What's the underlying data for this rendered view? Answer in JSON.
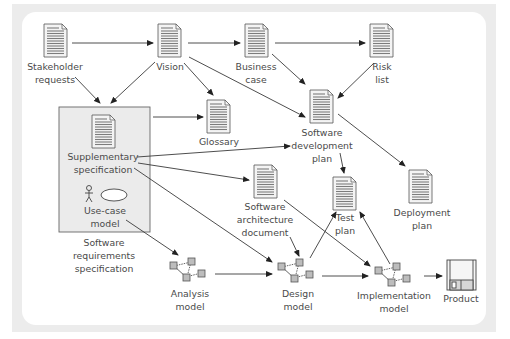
{
  "diagram": {
    "type": "artifact-flow",
    "nodes": [
      {
        "id": "stakeholder-requests",
        "icon": "document-icon",
        "label_lines": [
          "Stakeholder",
          "requests"
        ]
      },
      {
        "id": "vision",
        "icon": "document-icon",
        "label_lines": [
          "Vision"
        ]
      },
      {
        "id": "business-case",
        "icon": "document-icon",
        "label_lines": [
          "Business",
          "case"
        ]
      },
      {
        "id": "risk-list",
        "icon": "document-icon",
        "label_lines": [
          "Risk",
          "list"
        ]
      },
      {
        "id": "glossary",
        "icon": "document-icon",
        "label_lines": [
          "Glossary"
        ]
      },
      {
        "id": "supplementary-specification",
        "icon": "document-icon",
        "label_lines": [
          "Supplementary",
          "specification"
        ]
      },
      {
        "id": "use-case-model",
        "icon": "use-case-icon",
        "label_lines": [
          "Use-case",
          "model"
        ]
      },
      {
        "id": "software-requirements-specification",
        "icon": "group-box",
        "label_lines": [
          "Software",
          "requirements",
          "specification"
        ]
      },
      {
        "id": "software-development-plan",
        "icon": "document-icon",
        "label_lines": [
          "Software",
          "development",
          "plan"
        ]
      },
      {
        "id": "software-architecture-document",
        "icon": "document-icon",
        "label_lines": [
          "Software",
          "architecture",
          "document"
        ]
      },
      {
        "id": "test-plan",
        "icon": "document-icon",
        "label_lines": [
          "Test",
          "plan"
        ]
      },
      {
        "id": "deployment-plan",
        "icon": "document-icon",
        "label_lines": [
          "Deployment",
          "plan"
        ]
      },
      {
        "id": "analysis-model",
        "icon": "model-graph-icon",
        "label_lines": [
          "Analysis",
          "model"
        ]
      },
      {
        "id": "design-model",
        "icon": "model-graph-icon",
        "label_lines": [
          "Design",
          "model"
        ]
      },
      {
        "id": "implementation-model",
        "icon": "model-graph-icon",
        "label_lines": [
          "Implementation",
          "model"
        ]
      },
      {
        "id": "product",
        "icon": "floppy-disk-icon",
        "label_lines": [
          "Product"
        ]
      }
    ],
    "edges": [
      {
        "from": "stakeholder-requests",
        "to": "vision"
      },
      {
        "from": "vision",
        "to": "business-case"
      },
      {
        "from": "business-case",
        "to": "risk-list"
      },
      {
        "from": "stakeholder-requests",
        "to": "software-requirements-specification"
      },
      {
        "from": "vision",
        "to": "software-requirements-specification"
      },
      {
        "from": "vision",
        "to": "glossary"
      },
      {
        "from": "vision",
        "to": "software-development-plan"
      },
      {
        "from": "business-case",
        "to": "software-development-plan"
      },
      {
        "from": "risk-list",
        "to": "software-development-plan"
      },
      {
        "from": "software-requirements-specification",
        "to": "glossary"
      },
      {
        "from": "supplementary-specification",
        "to": "software-development-plan"
      },
      {
        "from": "supplementary-specification",
        "to": "software-architecture-document"
      },
      {
        "from": "supplementary-specification",
        "to": "design-model"
      },
      {
        "from": "software-development-plan",
        "to": "test-plan"
      },
      {
        "from": "software-development-plan",
        "to": "deployment-plan"
      },
      {
        "from": "use-case-model",
        "to": "analysis-model"
      },
      {
        "from": "analysis-model",
        "to": "design-model"
      },
      {
        "from": "software-architecture-document",
        "to": "design-model"
      },
      {
        "from": "software-architecture-document",
        "to": "implementation-model"
      },
      {
        "from": "design-model",
        "to": "test-plan"
      },
      {
        "from": "design-model",
        "to": "implementation-model"
      },
      {
        "from": "implementation-model",
        "to": "test-plan"
      },
      {
        "from": "implementation-model",
        "to": "product"
      }
    ]
  },
  "labels": {
    "stakeholder_1": "Stakeholder",
    "stakeholder_2": "requests",
    "vision": "Vision",
    "business_1": "Business",
    "business_2": "case",
    "risk_1": "Risk",
    "risk_2": "list",
    "glossary": "Glossary",
    "supp_1": "Supplementary",
    "supp_2": "specification",
    "usecase_1": "Use-case",
    "usecase_2": "model",
    "srs_1": "Software",
    "srs_2": "requirements",
    "srs_3": "specification",
    "sdp_1": "Software",
    "sdp_2": "development",
    "sdp_3": "plan",
    "sad_1": "Software",
    "sad_2": "architecture",
    "sad_3": "document",
    "test_1": "Test",
    "test_2": "plan",
    "deploy_1": "Deployment",
    "deploy_2": "plan",
    "analysis_1": "Analysis",
    "analysis_2": "model",
    "design_1": "Design",
    "design_2": "model",
    "impl_1": "Implementation",
    "impl_2": "model",
    "product": "Product"
  },
  "colors": {
    "frame": "#ececec",
    "panel": "#ffffff",
    "srs_box": "#ebebeb",
    "document_fill": "#9a9a9a",
    "text": "#4a4a4a",
    "line": "#3a3a3a"
  }
}
